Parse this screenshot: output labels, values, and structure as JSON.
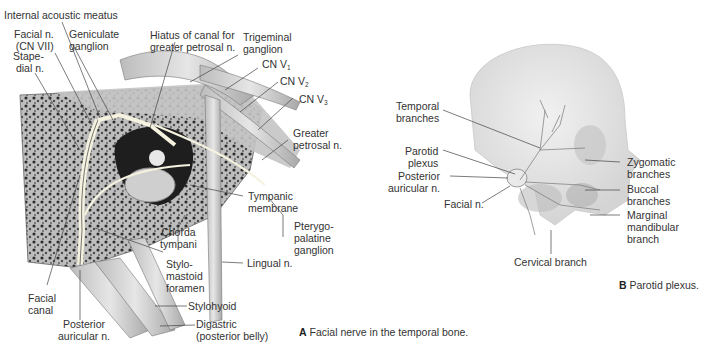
{
  "figure_a": {
    "caption_letter": "A",
    "caption_text": "Facial nerve in the temporal bone.",
    "labels": {
      "internal_acoustic_meatus": "Internal acoustic meatus",
      "facial_n": "Facial n.\n(CN VII)",
      "geniculate_ganglion": "Geniculate\nganglion",
      "stapedial_n": "Stape-\ndial n.",
      "hiatus": "Hiatus of canal for\ngreater petrosal n.",
      "trigeminal_ganglion": "Trigeminal\nganglion",
      "cn_v1": "CN V",
      "cn_v1_sub": "1",
      "cn_v2": "CN V",
      "cn_v2_sub": "2",
      "cn_v3": "CN V",
      "cn_v3_sub": "3",
      "greater_petrosal_n": "Greater\npetrosal n.",
      "tympanic_membrane": "Tympanic\nmembrane",
      "pterygopalatine_ganglion": "Pterygo-\npalatine\nganglion",
      "chorda_tympani": "Chorda\ntympani",
      "stylomastoid_foramen": "Stylo-\nmastoid\nforamen",
      "lingual_n": "Lingual n.",
      "facial_canal": "Facial\ncanal",
      "stylohyoid": "Stylohyoid",
      "posterior_auricular_n": "Posterior\nauricular n.",
      "digastric": "Digastric\n(posterior belly)"
    }
  },
  "figure_b": {
    "caption_letter": "B",
    "caption_text": "Parotid plexus.",
    "labels": {
      "temporal_branches": "Temporal\nbranches",
      "parotid_plexus": "Parotid\nplexus",
      "posterior_auricular_n": "Posterior\nauricular n.",
      "facial_n": "Facial n.",
      "zygomatic_branches": "Zygomatic\nbranches",
      "buccal_branches": "Buccal\nbranches",
      "marginal_mandibular_branch": "Marginal\nmandibular\nbranch",
      "cervical_branch": "Cervical branch"
    }
  },
  "colors": {
    "bone": "#cfcfcf",
    "bone_dark": "#3a3a3a",
    "nerve": "#f4f1df",
    "leader": "#444444",
    "muscle": "#d9d9d9"
  }
}
